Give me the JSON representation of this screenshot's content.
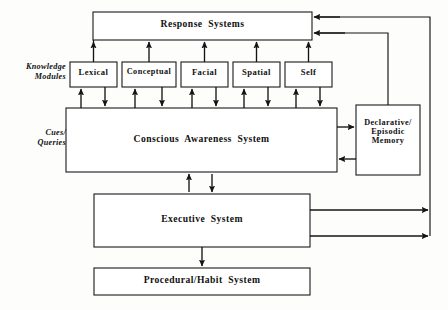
{
  "diagram": {
    "ink_color": "#141414",
    "paper_color": "#fdfdfc",
    "side_labels": [
      {
        "id": "knowledge-modules",
        "text": "Knowledge\nModules"
      },
      {
        "id": "cues-queries",
        "text": "Cues/\nQueries"
      }
    ],
    "boxes": [
      {
        "id": "response-systems",
        "label": "Response  Systems",
        "x": 93,
        "y": 12,
        "w": 219,
        "h": 28
      },
      {
        "id": "lexical",
        "label": "Lexical",
        "x": 70,
        "y": 62,
        "w": 47,
        "h": 25
      },
      {
        "id": "conceptual",
        "label": "Conceptual",
        "x": 122,
        "y": 62,
        "w": 54,
        "h": 25
      },
      {
        "id": "facial",
        "label": "Facial",
        "x": 181,
        "y": 62,
        "w": 47,
        "h": 25
      },
      {
        "id": "spatial",
        "label": "Spatial",
        "x": 233,
        "y": 62,
        "w": 47,
        "h": 25
      },
      {
        "id": "self",
        "label": "Self",
        "x": 285,
        "y": 62,
        "w": 47,
        "h": 25
      },
      {
        "id": "conscious-awareness-system",
        "label": "Conscious  Awareness  System",
        "x": 66,
        "y": 108,
        "w": 271,
        "h": 64
      },
      {
        "id": "declarative-episodic-memory",
        "label": "Declarative/\nEpisodic\nMemory",
        "x": 356,
        "y": 105,
        "w": 64,
        "h": 70
      },
      {
        "id": "executive-system",
        "label": "Executive  System",
        "x": 94,
        "y": 194,
        "w": 216,
        "h": 53
      },
      {
        "id": "procedural-habit-system",
        "label": "Procedural/Habit  System",
        "x": 94,
        "y": 268,
        "w": 216,
        "h": 27
      }
    ]
  }
}
